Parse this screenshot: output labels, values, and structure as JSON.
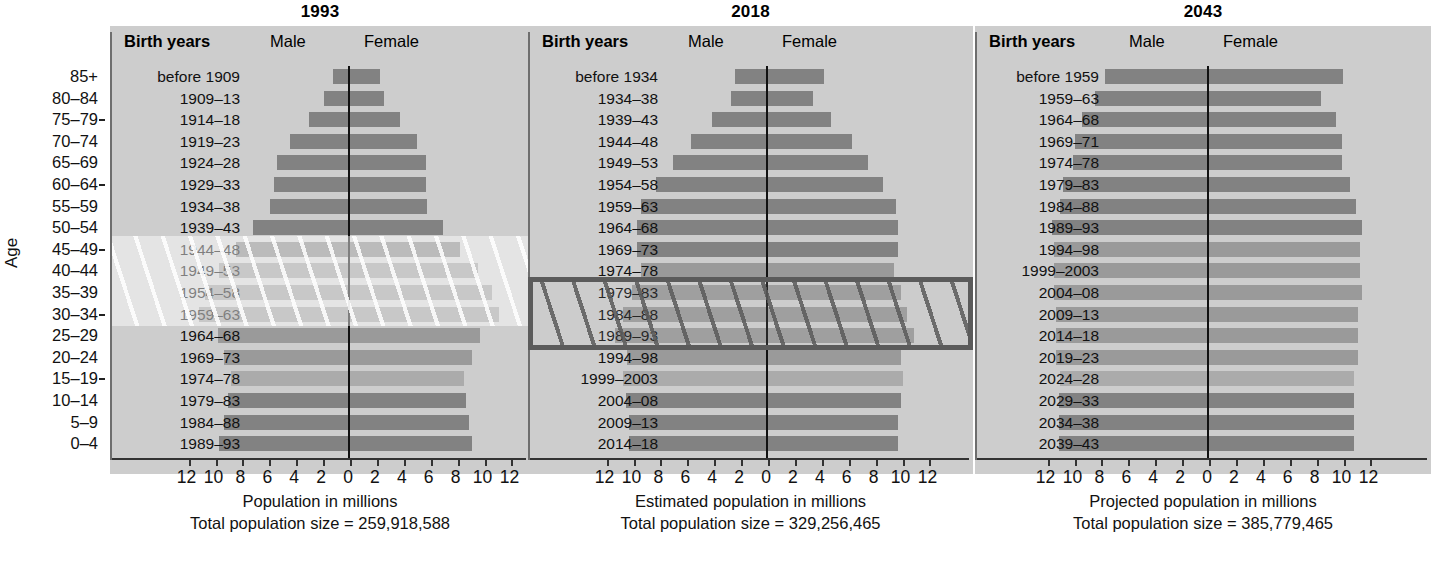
{
  "age_axis": {
    "title": "Age",
    "labels": [
      "85+",
      "80–84",
      "75–79",
      "70–74",
      "65–69",
      "60–64",
      "55–59",
      "50–54",
      "45–49",
      "40–44",
      "35–39",
      "30–34",
      "25–29",
      "20–24",
      "15–19",
      "10–14",
      "5–9",
      "0–4"
    ],
    "tick_rows": [
      2,
      5,
      8,
      11,
      14
    ]
  },
  "headers": {
    "birth_years": "Birth years",
    "male": "Male",
    "female": "Female"
  },
  "xtick_labels": [
    "12",
    "10",
    "8",
    "6",
    "4",
    "2",
    "0",
    "2",
    "4",
    "6",
    "8",
    "10",
    "12"
  ],
  "colors": {
    "panel_bg": "#cdcdcd",
    "bar_dark": "#828282",
    "bar_mid": "#9a9a9a",
    "bar_light": "#ababab",
    "zero_line": "#111111",
    "highlight_border": "#5b5b5b"
  },
  "chart_data": [
    {
      "type": "bar",
      "title": "1993",
      "xlabel": "Population in millions",
      "total_label": "Total population size = 259,918,588",
      "total_population": 259918588,
      "ylabel": "Age",
      "xlim": [
        -12,
        12
      ],
      "xticks": [
        12,
        10,
        8,
        6,
        4,
        2,
        0,
        2,
        4,
        6,
        8,
        10,
        12
      ],
      "grid": false,
      "legend": [
        "Male",
        "Female"
      ],
      "categories": [
        "85+",
        "80–84",
        "75–79",
        "70–74",
        "65–69",
        "60–64",
        "55–59",
        "50–54",
        "45–49",
        "40–44",
        "35–39",
        "30–34",
        "25–29",
        "20–24",
        "15–19",
        "10–14",
        "5–9",
        "0–4"
      ],
      "birth_years": [
        "before 1909",
        "1909–13",
        "1914–18",
        "1919–23",
        "1924–28",
        "1929–33",
        "1934–38",
        "1939–43",
        "1944–48",
        "1949–53",
        "1954–58",
        "1959–63",
        "1964–68",
        "1969–73",
        "1974–78",
        "1979–83",
        "1984–88",
        "1989–93"
      ],
      "series": [
        {
          "name": "Male",
          "values": [
            1.1,
            1.8,
            2.9,
            4.3,
            5.3,
            5.5,
            5.8,
            7.1,
            8.3,
            9.6,
            10.6,
            11.1,
            9.7,
            9.2,
            8.7,
            8.9,
            9.2,
            9.6
          ]
        },
        {
          "name": "Female",
          "values": [
            2.4,
            2.7,
            3.9,
            5.1,
            5.8,
            5.8,
            5.9,
            7.1,
            8.3,
            9.7,
            10.7,
            11.2,
            9.8,
            9.2,
            8.6,
            8.8,
            9.0,
            9.2
          ]
        }
      ],
      "bar_shades": [
        "dark",
        "dark",
        "dark",
        "dark",
        "dark",
        "dark",
        "dark",
        "dark",
        "dark",
        "mid",
        "mid",
        "mid",
        "mid",
        "mid",
        "light",
        "dark",
        "dark",
        "dark"
      ],
      "highlight": {
        "type": "soft",
        "rows": [
          8,
          9,
          10,
          11
        ],
        "label": "baby-boom cohort 1944–1963"
      }
    },
    {
      "type": "bar",
      "title": "2018",
      "xlabel": "Estimated population in millions",
      "total_label": "Total population size = 329,256,465",
      "total_population": 329256465,
      "ylabel": "Age",
      "xlim": [
        -12,
        12
      ],
      "xticks": [
        12,
        10,
        8,
        6,
        4,
        2,
        0,
        2,
        4,
        6,
        8,
        10,
        12
      ],
      "grid": false,
      "legend": [
        "Male",
        "Female"
      ],
      "categories": [
        "85+",
        "80–84",
        "75–79",
        "70–74",
        "65–69",
        "60–64",
        "55–59",
        "50–54",
        "45–49",
        "40–44",
        "35–39",
        "30–34",
        "25–29",
        "20–24",
        "15–19",
        "10–14",
        "5–9",
        "0–4"
      ],
      "birth_years": [
        "before 1934",
        "1934–38",
        "1939–43",
        "1944–48",
        "1949–53",
        "1954–58",
        "1959–63",
        "1964–68",
        "1969–73",
        "1974–78",
        "1979–83",
        "1984–88",
        "1989–93",
        "1994–98",
        "1999–2003",
        "2004–08",
        "2009–13",
        "2014–18"
      ],
      "series": [
        {
          "name": "Male",
          "values": [
            2.3,
            2.6,
            4.0,
            5.6,
            6.9,
            8.2,
            9.3,
            9.6,
            9.6,
            9.3,
            10.0,
            10.6,
            11.2,
            10.3,
            10.6,
            10.4,
            10.2,
            10.2
          ]
        },
        {
          "name": "Female",
          "values": [
            4.3,
            3.5,
            4.8,
            6.4,
            7.6,
            8.7,
            9.7,
            9.8,
            9.8,
            9.5,
            10.0,
            10.5,
            11.0,
            10.0,
            10.2,
            10.0,
            9.8,
            9.8
          ]
        }
      ],
      "bar_shades": [
        "dark",
        "dark",
        "dark",
        "dark",
        "dark",
        "dark",
        "dark",
        "dark",
        "dark",
        "mid",
        "mid",
        "mid",
        "mid",
        "mid",
        "light",
        "dark",
        "dark",
        "dark"
      ],
      "highlight": {
        "type": "box",
        "rows": [
          10,
          11,
          12
        ],
        "label": "echo baby-boom cohort 1979–1993"
      }
    },
    {
      "type": "bar",
      "title": "2043",
      "xlabel": "Projected population in millions",
      "total_label": "Total population size = 385,779,465",
      "total_population": 385779465,
      "ylabel": "Age",
      "xlim": [
        -12,
        12
      ],
      "xticks": [
        12,
        10,
        8,
        6,
        4,
        2,
        0,
        2,
        4,
        6,
        8,
        10,
        12
      ],
      "grid": false,
      "legend": [
        "Male",
        "Female"
      ],
      "categories": [
        "85+",
        "80–84",
        "75–79",
        "70–74",
        "65–69",
        "60–64",
        "55–59",
        "50–54",
        "45–49",
        "40–44",
        "35–39",
        "30–34",
        "25–29",
        "20–24",
        "15–19",
        "10–14",
        "5–9",
        "0–4"
      ],
      "birth_years": [
        "before 1959",
        "1959–63",
        "1964–68",
        "1969–71",
        "1974–78",
        "1979–83",
        "1984–88",
        "1989–93",
        "1994–98",
        "1999–2003",
        "2004–08",
        "2009–13",
        "2014–18",
        "2019–23",
        "2024–28",
        "2029–33",
        "2034–38",
        "2039–43"
      ],
      "series": [
        {
          "name": "Male",
          "values": [
            7.6,
            8.3,
            9.3,
            9.8,
            10.0,
            10.7,
            10.9,
            11.5,
            11.4,
            11.4,
            11.4,
            11.2,
            11.2,
            11.2,
            10.9,
            11.0,
            11.0,
            11.0
          ]
        },
        {
          "name": "Female",
          "values": [
            10.1,
            8.5,
            9.6,
            10.0,
            10.0,
            10.6,
            11.1,
            11.5,
            11.4,
            11.4,
            11.5,
            11.2,
            11.2,
            11.2,
            10.9,
            10.9,
            10.9,
            10.9
          ]
        }
      ],
      "bar_shades": [
        "dark",
        "dark",
        "dark",
        "dark",
        "dark",
        "dark",
        "dark",
        "dark",
        "mid",
        "mid",
        "mid",
        "mid",
        "mid",
        "mid",
        "light",
        "dark",
        "dark",
        "dark"
      ],
      "highlight": null
    }
  ]
}
